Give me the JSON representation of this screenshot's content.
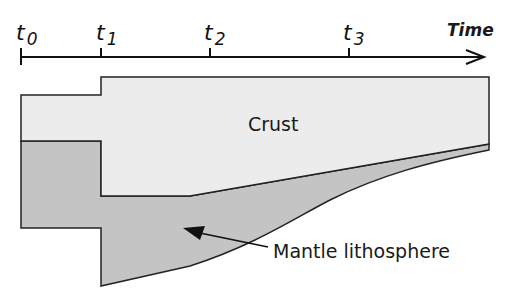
{
  "axis": {
    "label": "Time",
    "ticks": [
      {
        "name": "t",
        "sub": "0",
        "x": 21
      },
      {
        "name": "t",
        "sub": "1",
        "x": 101
      },
      {
        "name": "t",
        "sub": "2",
        "x": 210
      },
      {
        "name": "t",
        "sub": "3",
        "x": 349
      }
    ]
  },
  "regions": {
    "crust": {
      "label": "Crust",
      "color": "#ececec"
    },
    "mantle": {
      "label": "Mantle lithosphere",
      "color": "#c4c4c4"
    }
  },
  "colors": {
    "outline": "#222222",
    "background": "#ffffff"
  }
}
